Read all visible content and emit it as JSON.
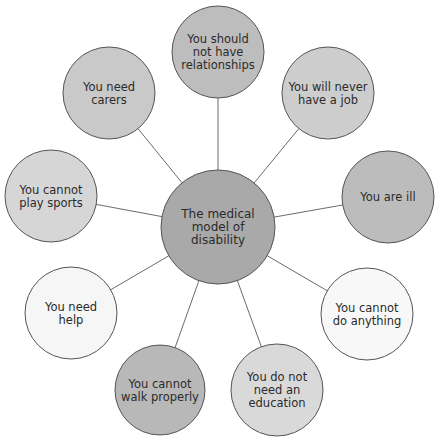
{
  "diagram": {
    "type": "spider-diagram",
    "center": {
      "id": "center",
      "lines": [
        "The medical",
        "model of",
        "disability"
      ],
      "fill": "#a9a9a9"
    },
    "nodes": [
      {
        "id": "relationships",
        "lines": [
          "You should",
          "not have",
          "relationships"
        ],
        "fill": "#bdbdbd"
      },
      {
        "id": "job",
        "lines": [
          "You will never",
          "have a job"
        ],
        "fill": "#cdcdcd"
      },
      {
        "id": "ill",
        "lines": [
          "You are ill"
        ],
        "fill": "#bcbcbc"
      },
      {
        "id": "do-anything",
        "lines": [
          "You cannot",
          "do anything"
        ],
        "fill": "#f8f8f8"
      },
      {
        "id": "education",
        "lines": [
          "You do not",
          "need an",
          "education"
        ],
        "fill": "#d9d9d9"
      },
      {
        "id": "walk",
        "lines": [
          "You cannot",
          "walk properly"
        ],
        "fill": "#b8b8b8"
      },
      {
        "id": "help",
        "lines": [
          "You need",
          "help"
        ],
        "fill": "#f6f6f6"
      },
      {
        "id": "sports",
        "lines": [
          "You cannot",
          "play sports"
        ],
        "fill": "#d6d6d6"
      },
      {
        "id": "carers",
        "lines": [
          "You need",
          "carers"
        ],
        "fill": "#c9c9c9"
      }
    ]
  }
}
